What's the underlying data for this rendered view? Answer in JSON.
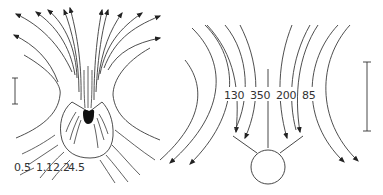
{
  "figure": {
    "left_panel": {
      "name": "field lines around organism",
      "labels": [
        "0.5",
        "1.1",
        "2.2",
        "4.5"
      ],
      "scale_bar": true
    },
    "right_panel": {
      "name": "field lines around sphere",
      "labels": [
        "130",
        "350",
        "200",
        "85"
      ],
      "scale_bar": true
    },
    "colors": {
      "line": "#3a3a3a",
      "background": "#ffffff"
    }
  }
}
